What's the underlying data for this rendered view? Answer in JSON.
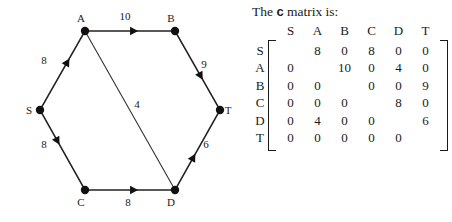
{
  "figure": {
    "graph": {
      "nodes": [
        {
          "id": "S",
          "label": "S",
          "x": 40,
          "y": 110,
          "label_dx": -11,
          "label_dy": 4
        },
        {
          "id": "A",
          "label": "A",
          "x": 85,
          "y": 31,
          "label_dx": -4,
          "label_dy": -9
        },
        {
          "id": "B",
          "label": "B",
          "x": 175,
          "y": 31,
          "label_dx": -4,
          "label_dy": -9
        },
        {
          "id": "C",
          "label": "C",
          "x": 85,
          "y": 190,
          "label_dx": -4,
          "label_dy": 16
        },
        {
          "id": "D",
          "label": "D",
          "x": 175,
          "y": 190,
          "label_dx": -4,
          "label_dy": 16
        },
        {
          "id": "T",
          "label": "T",
          "x": 220,
          "y": 110,
          "label_dx": 8,
          "label_dy": 4
        }
      ],
      "edges": [
        {
          "from": "S",
          "to": "A",
          "label": "8",
          "label_x": 44,
          "label_y": 64,
          "arrow_t": 0.62
        },
        {
          "from": "A",
          "to": "B",
          "label": "10",
          "label_x": 125,
          "label_y": 20,
          "arrow_t": 0.55
        },
        {
          "from": "B",
          "to": "T",
          "label": "9",
          "label_x": 204,
          "label_y": 68,
          "arrow_t": 0.58
        },
        {
          "from": "S",
          "to": "C",
          "label": "8",
          "label_x": 44,
          "label_y": 148,
          "arrow_t": 0.38
        },
        {
          "from": "C",
          "to": "D",
          "label": "8",
          "label_x": 128,
          "label_y": 206,
          "arrow_t": 0.55
        },
        {
          "from": "D",
          "to": "T",
          "label": "6",
          "label_x": 206,
          "label_y": 148,
          "arrow_t": 0.4
        },
        {
          "from": "A",
          "to": "D",
          "label": "4",
          "label_x": 137,
          "label_y": 108,
          "arrow_t": -1
        }
      ]
    },
    "matrix": {
      "caption_prefix": "The ",
      "caption_symbol": "c",
      "caption_suffix": " matrix is:",
      "col_headers": [
        "S",
        "A",
        "B",
        "C",
        "D",
        "T"
      ],
      "row_headers": [
        "S",
        "A",
        "B",
        "C",
        "D",
        "T"
      ],
      "rows": [
        [
          "",
          "8",
          "0",
          "8",
          "0",
          "0"
        ],
        [
          "0",
          "",
          "10",
          "0",
          "4",
          "0"
        ],
        [
          "0",
          "0",
          "",
          "0",
          "0",
          "9"
        ],
        [
          "0",
          "0",
          "0",
          "",
          "8",
          "0"
        ],
        [
          "0",
          "4",
          "0",
          "0",
          "",
          "6"
        ],
        [
          "0",
          "0",
          "0",
          "0",
          "0",
          ""
        ]
      ]
    }
  },
  "colors": {
    "ink": "#1a1a1a",
    "edge": "#222222",
    "background": "#ffffff"
  }
}
